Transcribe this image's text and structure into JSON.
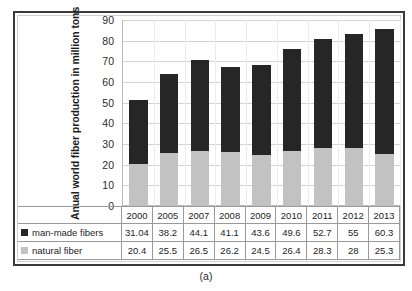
{
  "caption": "(a)",
  "chart_data": {
    "type": "bar",
    "subtype": "stacked-bar",
    "title": "",
    "xlabel": "",
    "ylabel": "Anual world fiber production in million tons",
    "ylim": [
      0,
      90
    ],
    "ytick_step": 10,
    "yticks": [
      "90",
      "80",
      "70",
      "60",
      "50",
      "40",
      "30",
      "20",
      "10",
      "0"
    ],
    "grid": true,
    "legend_position": "table-left",
    "categories": [
      "2000",
      "2005",
      "2007",
      "2008",
      "2009",
      "2010",
      "2011",
      "2012",
      "2013"
    ],
    "series": [
      {
        "name": "man-made fibers",
        "color": "#262626",
        "values": [
          31.04,
          38.2,
          44.1,
          41.1,
          43.6,
          49.6,
          52.7,
          55,
          60.3
        ],
        "labels": [
          "31.04",
          "38.2",
          "44.1",
          "41.1",
          "43.6",
          "49.6",
          "52.7",
          "55",
          "60.3"
        ]
      },
      {
        "name": "natural fiber",
        "color": "#c2c2c2",
        "values": [
          20.4,
          25.5,
          26.5,
          26.2,
          24.5,
          26.4,
          28.3,
          28,
          25.3
        ],
        "labels": [
          "20.4",
          "25.5",
          "26.5",
          "26.2",
          "24.5",
          "26.4",
          "28.3",
          "28",
          "25.3"
        ]
      }
    ],
    "stack_order": [
      "natural fiber",
      "man-made fibers"
    ]
  }
}
